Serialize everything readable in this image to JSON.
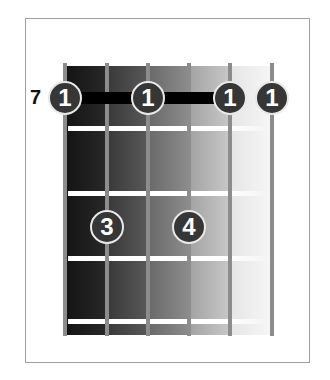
{
  "diagram": {
    "type": "guitar-chord-diagram",
    "starting_fret_label": "7",
    "strings": 6,
    "frets_shown": 4,
    "barre": {
      "finger": "1",
      "fret": 1,
      "from_string": 1,
      "to_string": 5
    },
    "fingers": [
      {
        "label": "1",
        "string": 1,
        "fret": 1
      },
      {
        "label": "1",
        "string": 3,
        "fret": 1
      },
      {
        "label": "1",
        "string": 5,
        "fret": 1
      },
      {
        "label": "1",
        "string": 6,
        "fret": 1
      },
      {
        "label": "3",
        "string": 2,
        "fret": 2
      },
      {
        "label": "4",
        "string": 4,
        "fret": 2
      }
    ],
    "colors": {
      "frame_border": "#a0a0a0",
      "string": "#8c8c8c",
      "fret_line": "#ffffff",
      "barre": "#000000",
      "finger_fill": "#363636",
      "finger_stroke": "#e8e8e8",
      "finger_text": "#ffffff",
      "label_text": "#111111"
    }
  }
}
